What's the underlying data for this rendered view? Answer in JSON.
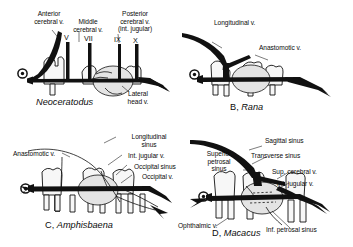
{
  "figure": {
    "ink_color": "#111111",
    "bone_color": "#f2f2f2",
    "brain_fill": "#e3e3e3"
  },
  "panels": [
    {
      "id": "A",
      "caption_prefix": "",
      "caption_taxon": "Neoceratodus",
      "labels": [
        {
          "name": "anterior-cerebral-vein",
          "text": "Anterior\ncerebral v."
        },
        {
          "name": "middle-cerebral-vein",
          "text": "Middle\ncerebral v."
        },
        {
          "name": "posterior-cerebral-vein",
          "text": "Posterior\ncerebral v.\n(int. jugular)"
        },
        {
          "name": "lateral-head-vein",
          "text": "Lateral\nhead v."
        }
      ],
      "nerves": [
        "V",
        "VII",
        "IX",
        "X"
      ]
    },
    {
      "id": "B",
      "caption_prefix": "B, ",
      "caption_taxon": "Rana",
      "labels": [
        {
          "name": "longitudinal-vein",
          "text": "Longitudinal v."
        },
        {
          "name": "anastomotic-vein",
          "text": "Anastomotic v."
        }
      ],
      "nerves": []
    },
    {
      "id": "C",
      "caption_prefix": "C, ",
      "caption_taxon": "Amphisbaena",
      "labels": [
        {
          "name": "longitudinal-sinus",
          "text": "Longitudinal\nsinus"
        },
        {
          "name": "anastomotic-vein",
          "text": "Anastomotic v."
        },
        {
          "name": "internal-jugular-vein",
          "text": "Int. jugular v."
        },
        {
          "name": "occipital-sinus",
          "text": "Occipital sinus"
        },
        {
          "name": "occipital-vein",
          "text": "Occipital v."
        }
      ],
      "nerves": []
    },
    {
      "id": "D",
      "caption_prefix": "D, ",
      "caption_taxon": "Macacus",
      "labels": [
        {
          "name": "sagittal-sinus",
          "text": "Sagittal sinus"
        },
        {
          "name": "transverse-sinus",
          "text": "Transverse sinus"
        },
        {
          "name": "superior-petrosal-sinus",
          "text": "Superior\npetrosal\nsinus"
        },
        {
          "name": "superior-cerebral-vein",
          "text": "Sup. cerebral v."
        },
        {
          "name": "internal-jugular-vein",
          "text": "Int. jugular v."
        },
        {
          "name": "ophthalmic-vein",
          "text": "Ophthalmic v."
        },
        {
          "name": "inferior-petrosal-sinus",
          "text": "Inf. petrosal sinus"
        }
      ],
      "nerves": []
    }
  ]
}
